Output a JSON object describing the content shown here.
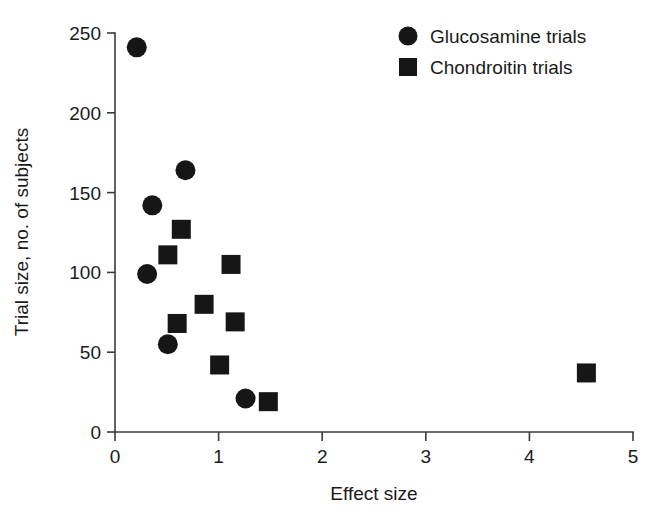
{
  "chart_data": {
    "type": "scatter",
    "title": "",
    "xlabel": "Effect size",
    "ylabel": "Trial size, no. of subjects",
    "xlim": [
      0,
      5
    ],
    "ylim": [
      0,
      250
    ],
    "xticks": [
      "0",
      "1",
      "2",
      "3",
      "4",
      "5"
    ],
    "xtick_values": [
      0,
      1,
      2,
      3,
      4,
      5
    ],
    "yticks": [
      "0",
      "50",
      "100",
      "150",
      "200",
      "250"
    ],
    "ytick_values": [
      0,
      50,
      100,
      150,
      200,
      250
    ],
    "grid": false,
    "legend_position": "top-right",
    "series": [
      {
        "name": "Glucosamine trials",
        "marker": "circle",
        "color": "#161616",
        "points": [
          {
            "x": 0.21,
            "y": 241
          },
          {
            "x": 0.36,
            "y": 142
          },
          {
            "x": 0.31,
            "y": 99
          },
          {
            "x": 0.68,
            "y": 164
          },
          {
            "x": 0.51,
            "y": 55
          },
          {
            "x": 1.26,
            "y": 21
          }
        ]
      },
      {
        "name": "Chondroitin trials",
        "marker": "square",
        "color": "#161616",
        "points": [
          {
            "x": 0.64,
            "y": 127
          },
          {
            "x": 0.51,
            "y": 111
          },
          {
            "x": 1.12,
            "y": 105
          },
          {
            "x": 0.86,
            "y": 80
          },
          {
            "x": 0.6,
            "y": 68
          },
          {
            "x": 1.16,
            "y": 69
          },
          {
            "x": 1.01,
            "y": 42
          },
          {
            "x": 1.48,
            "y": 19
          },
          {
            "x": 4.55,
            "y": 37
          }
        ]
      }
    ]
  },
  "legend": {
    "items": [
      {
        "label": "Glucosamine trials",
        "marker": "circle"
      },
      {
        "label": "Chondroitin trials",
        "marker": "square"
      }
    ]
  }
}
